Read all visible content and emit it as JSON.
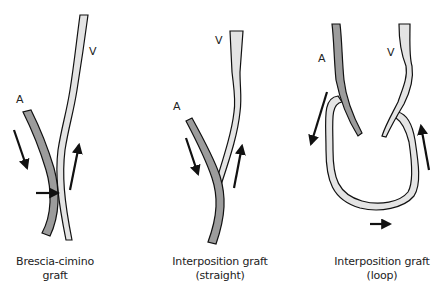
{
  "colors": {
    "artery_fill": "#9c9c9c",
    "vein_fill": "#e4e4e4",
    "outline": "#111111",
    "arrow": "#111111"
  },
  "panels": [
    {
      "id": "brescia-cimino",
      "caption_line1": "Brescia-cimino",
      "caption_line2": "graft",
      "labels": {
        "artery": "A",
        "vein": "V"
      },
      "arrows": [
        "down (arterial inflow)",
        "up (venous outflow)",
        "right (anastomosis)"
      ]
    },
    {
      "id": "interposition-straight",
      "caption_line1": "Interposition graft",
      "caption_line2": "(straight)",
      "labels": {
        "artery": "A",
        "vein": "V"
      },
      "arrows": [
        "down (arterial inflow)",
        "up (venous outflow)"
      ]
    },
    {
      "id": "interposition-loop",
      "caption_line1": "Interposition graft",
      "caption_line2": "(loop)",
      "labels": {
        "artery": "A",
        "vein": "V"
      },
      "arrows": [
        "down-left (into loop)",
        "up (out of loop)",
        "right (bottom of loop)"
      ]
    }
  ]
}
